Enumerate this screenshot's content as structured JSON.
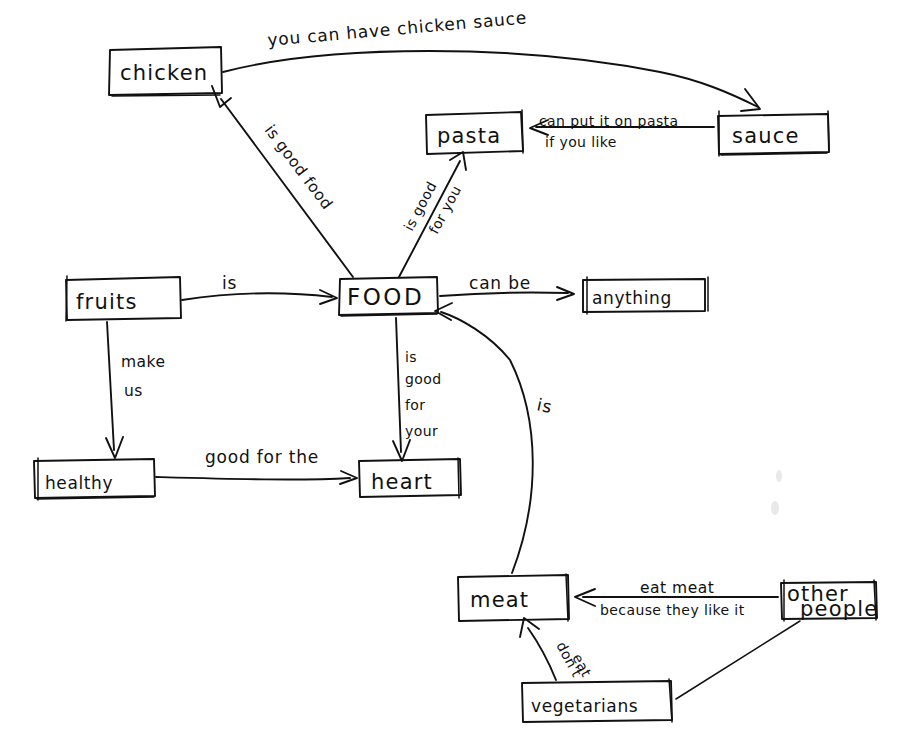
{
  "canvas": {
    "width": 911,
    "height": 756,
    "background": "#ffffff",
    "ink": "#111111",
    "title": "hand-drawn concept map about FOOD"
  },
  "nodes": [
    {
      "id": "chicken",
      "label": "chicken",
      "x": 109,
      "y": 49,
      "w": 112,
      "h": 46
    },
    {
      "id": "sauce",
      "label": "sauce",
      "x": 717,
      "y": 113,
      "w": 112,
      "h": 41
    },
    {
      "id": "pasta",
      "label": "pasta",
      "x": 424,
      "y": 112,
      "w": 99,
      "h": 41
    },
    {
      "id": "food",
      "label": "FOOD",
      "x": 338,
      "y": 276,
      "w": 100,
      "h": 38
    },
    {
      "id": "fruits",
      "label": "fruits",
      "x": 65,
      "y": 277,
      "w": 115,
      "h": 42
    },
    {
      "id": "anything",
      "label": "anything",
      "x": 581,
      "y": 277,
      "w": 124,
      "h": 34
    },
    {
      "id": "healthy",
      "label": "healthy",
      "x": 32,
      "y": 458,
      "w": 122,
      "h": 40
    },
    {
      "id": "heart",
      "label": "heart",
      "x": 357,
      "y": 459,
      "w": 104,
      "h": 38
    },
    {
      "id": "meat",
      "label": "meat",
      "x": 456,
      "y": 574,
      "w": 113,
      "h": 47
    },
    {
      "id": "otherpeople",
      "label": "other people",
      "x": 779,
      "y": 581,
      "w": 99,
      "h": 38
    },
    {
      "id": "vegetarians",
      "label": "vegetarians",
      "x": 520,
      "y": 680,
      "w": 152,
      "h": 41
    }
  ],
  "edges": [
    {
      "id": "chicken-sauce",
      "from": "chicken",
      "to": "sauce",
      "label": "you can have chicken sauce"
    },
    {
      "id": "food-chicken",
      "from": "FOOD",
      "to": "chicken",
      "label": "is good food"
    },
    {
      "id": "sauce-pasta",
      "from": "sauce",
      "to": "pasta",
      "label_line1": "can put it on pasta",
      "label_line2": "if you like"
    },
    {
      "id": "food-pasta",
      "from": "FOOD",
      "to": "pasta",
      "label_line1": "is good",
      "label_line2": "for you"
    },
    {
      "id": "fruits-food",
      "from": "fruits",
      "to": "FOOD",
      "label": "is"
    },
    {
      "id": "food-anything",
      "from": "FOOD",
      "to": "anything",
      "label": "can be"
    },
    {
      "id": "fruits-healthy",
      "from": "fruits",
      "to": "healthy",
      "label_line1": "make",
      "label_line2": "us"
    },
    {
      "id": "food-heart",
      "from": "FOOD",
      "to": "heart",
      "label_line1": "is",
      "label_line2": "good",
      "label_line3": "for",
      "label_line4": "your"
    },
    {
      "id": "healthy-heart",
      "from": "healthy",
      "to": "heart",
      "label": "good for the"
    },
    {
      "id": "meat-food",
      "from": "meat",
      "to": "FOOD",
      "label": "is"
    },
    {
      "id": "otherpeople-meat",
      "from": "other people",
      "to": "meat",
      "label_line1": "eat meat",
      "label_line2": "because they like it"
    },
    {
      "id": "vegetarians-meat",
      "from": "vegetarians",
      "to": "meat",
      "label_line1": "don't",
      "label_line2": "eat"
    }
  ]
}
